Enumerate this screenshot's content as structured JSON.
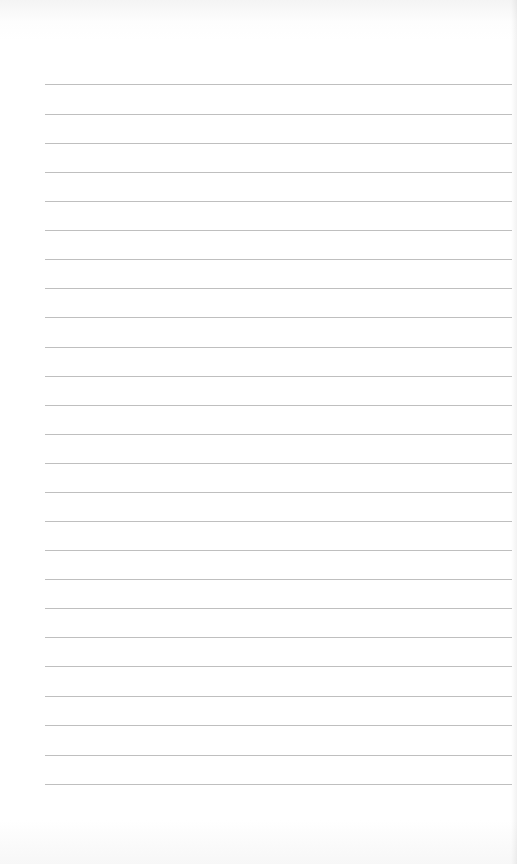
{
  "page": {
    "type": "blank lined notebook paper",
    "background_color": "#ffffff",
    "line_color": "#b8b8b8",
    "line_count": 25,
    "line_left_x": 45,
    "line_right_x": 512,
    "line_positions_y": [
      84,
      114,
      143,
      172,
      201,
      230,
      259,
      288,
      317,
      347,
      376,
      405,
      434,
      463,
      492,
      521,
      550,
      579,
      608,
      637,
      666,
      696,
      725,
      755,
      784
    ]
  }
}
